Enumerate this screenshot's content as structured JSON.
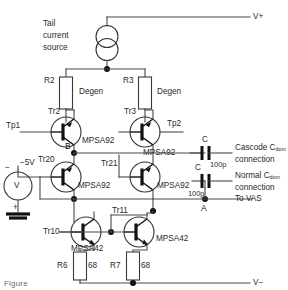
{
  "diagram": {
    "rails": {
      "positive": "V+",
      "negative": "V−"
    },
    "blocks": {
      "tail_current_source": "Tail\ncurrent\nsource",
      "tail_line1": "Tail",
      "tail_line2": "current",
      "tail_line3": "source",
      "degen_left": "Degen",
      "degen_right": "Degen"
    },
    "resistors": [
      {
        "ref": "R2",
        "value": ""
      },
      {
        "ref": "R3",
        "value": ""
      },
      {
        "ref": "R6",
        "value": "68"
      },
      {
        "ref": "R7",
        "value": "68"
      }
    ],
    "transistors": [
      {
        "ref": "Tr2",
        "part": "MPSA92"
      },
      {
        "ref": "Tr3",
        "part": "MPSA92"
      },
      {
        "ref": "Tr20",
        "part": "MPSA92"
      },
      {
        "ref": "Tr21",
        "part": "MPSA92"
      },
      {
        "ref": "Tr10",
        "part": "MPSA42"
      },
      {
        "ref": "Tr11",
        "part": "MPSA42"
      }
    ],
    "capacitors": [
      {
        "ref": "C",
        "value": "100p"
      },
      {
        "ref": "C",
        "value": "100p"
      }
    ],
    "source": {
      "ref": "V",
      "value": "−5V",
      "minus": "−",
      "plus": "+"
    },
    "test_points": [
      {
        "label": "Tp1"
      },
      {
        "label": "Tp2"
      }
    ],
    "nodes": [
      {
        "label": "B"
      },
      {
        "label": "A"
      }
    ],
    "annotations": [
      {
        "line1": "Cascode C",
        "sub": "dom",
        "line2": "connection"
      },
      {
        "line1": "Normal C",
        "sub": "dom",
        "line2": "connection"
      },
      {
        "line1": "To VAS",
        "sub": "",
        "line2": ""
      }
    ],
    "to_vas": "To VAS",
    "colors": {
      "wire": "#4a4a4a",
      "device": "#111111",
      "text": "#2a2a2a",
      "background": "#ffffff"
    },
    "caption_clipped": "Figure"
  }
}
